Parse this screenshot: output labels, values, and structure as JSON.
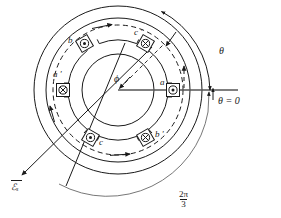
{
  "figure": {
    "type": "engineering-diagram",
    "width": 281,
    "height": 218,
    "background_color": "#ffffff",
    "line_color": "#1a1a1a",
    "axis_color": "#555555"
  },
  "center": {
    "x": 118,
    "y": 90,
    "label": "ϕ",
    "label_name": "flux-angle-phi"
  },
  "circles": [
    {
      "name": "stator-outer-circle",
      "r": 84,
      "style": "solid"
    },
    {
      "name": "stator-yoke-circle",
      "r": 72,
      "style": "solid"
    },
    {
      "name": "flux-path-dashed-circle",
      "r": 65,
      "style": "dashed"
    },
    {
      "name": "stator-bore-circle",
      "r": 50,
      "style": "solid"
    },
    {
      "name": "rotor-circle",
      "r": 36,
      "style": "solid"
    }
  ],
  "conductors": [
    {
      "id": "a",
      "label": "a",
      "polarity": "out-of-page",
      "marker": "circle-dot",
      "angle_deg": 0,
      "label_side": "above-left"
    },
    {
      "id": "ap",
      "label": "a ′",
      "polarity": "into-page",
      "marker": "circle-cross",
      "angle_deg": 180,
      "label_side": "above-left"
    },
    {
      "id": "b",
      "label": "b",
      "polarity": "out-of-page",
      "marker": "circle-dot",
      "angle_deg": 120,
      "label_side": "left"
    },
    {
      "id": "bp",
      "label": "b ′",
      "polarity": "into-page",
      "marker": "circle-cross",
      "angle_deg": -60,
      "label_side": "right"
    },
    {
      "id": "c",
      "label": "c",
      "polarity": "out-of-page",
      "marker": "circle-dot",
      "angle_deg": -120,
      "label_side": "right"
    },
    {
      "id": "cp",
      "label": "c ′",
      "polarity": "into-page",
      "marker": "circle-cross",
      "angle_deg": 60,
      "label_side": "above-left"
    }
  ],
  "annotations": {
    "theta_zero": {
      "text": "θ = 0",
      "name": "theta-zero-axis-label"
    },
    "theta": {
      "text": "θ",
      "name": "theta-angle-label"
    },
    "two_pi_over_three": {
      "numerator": "2π",
      "denominator": "3",
      "name": "two-pi-over-three-label"
    },
    "mmf_vector": {
      "text": "ℰ",
      "subscript": "s",
      "overline": true,
      "name": "mmf-vector-label"
    },
    "phi": {
      "text": "ϕ",
      "name": "phi-label"
    }
  },
  "flux_arrows": [
    {
      "name": "flux-arrow-top",
      "angle_deg": 70
    },
    {
      "name": "flux-arrow-right",
      "angle_deg": 22
    },
    {
      "name": "flux-arrow-bottom",
      "angle_deg": -68
    },
    {
      "name": "flux-arrow-left",
      "angle_deg": 200
    }
  ]
}
